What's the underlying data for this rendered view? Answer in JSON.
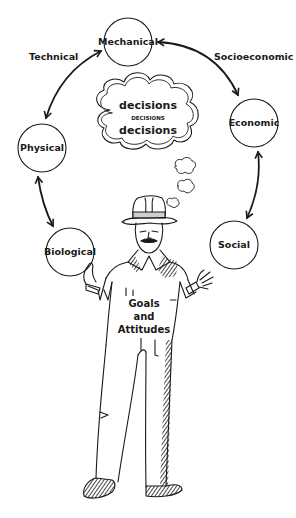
{
  "diagram": {
    "nodes": [
      {
        "id": "mechanical",
        "label": "Mechanical",
        "cx": 128,
        "cy": 42,
        "r": 24
      },
      {
        "id": "economic",
        "label": "Economic",
        "cx": 254,
        "cy": 123,
        "r": 24
      },
      {
        "id": "social",
        "label": "Social",
        "cx": 234,
        "cy": 245,
        "r": 24
      },
      {
        "id": "biological",
        "label": "Biological",
        "cx": 70,
        "cy": 252,
        "r": 24
      },
      {
        "id": "physical",
        "label": "Physical",
        "cx": 42,
        "cy": 148,
        "r": 24
      }
    ],
    "edges": [
      {
        "from": "mechanical",
        "to": "economic",
        "label": "Socioeconomic",
        "bidirectional": true
      },
      {
        "from": "economic",
        "to": "social",
        "label": "",
        "bidirectional": true
      },
      {
        "from": "mechanical",
        "to": "physical",
        "label": "Technical",
        "bidirectional": true
      },
      {
        "from": "physical",
        "to": "biological",
        "label": "",
        "bidirectional": true
      }
    ],
    "edge_labels": {
      "technical": "Technical",
      "socioeconomic": "Socioeconomic"
    },
    "thought_cloud": {
      "line1": "decisions",
      "line2": "DECISIONS",
      "line3": "decisions"
    },
    "figure": {
      "description": "man in hat and coveralls holding Biological circle, open hand toward Social circle",
      "text_line1": "Goals",
      "text_line2": "and",
      "text_line3": "Attitudes"
    },
    "ink_color": "#1a1a1a",
    "background": "#ffffff"
  }
}
